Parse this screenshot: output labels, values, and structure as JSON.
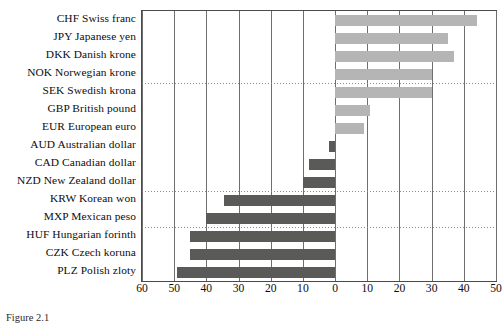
{
  "chart_data": {
    "type": "bar",
    "orientation": "horizontal",
    "title": "",
    "xlabel": "",
    "ylabel": "",
    "xlim": [
      -60,
      50
    ],
    "xticks": [
      -60,
      -50,
      -40,
      -30,
      -20,
      -10,
      0,
      10,
      20,
      30,
      40,
      50
    ],
    "xticklabels": [
      "60",
      "50",
      "40",
      "30",
      "20",
      "10",
      "0",
      "10",
      "20",
      "30",
      "40",
      "50"
    ],
    "grid": {
      "vertical": true,
      "horizontal_dotted": true
    },
    "legend": null,
    "colors": {
      "positive": "#b5b5b5",
      "negative": "#5a5a58",
      "axis": "#4a4a4a",
      "grid": "#6f6f6f"
    },
    "categories": [
      "CHF Swiss franc",
      "JPY Japanese yen",
      "DKK Danish krone",
      "NOK Norwegian krone",
      "SEK Swedish krona",
      "GBP British pound",
      "EUR European euro",
      "AUD Australian dollar",
      "CAD Canadian dollar",
      "NZD New Zealand dollar",
      "KRW Korean won",
      "MXP Mexican peso",
      "HUF Hungarian forinth",
      "CZK Czech koruna",
      "PLZ Polish zloty"
    ],
    "values": [
      44,
      35,
      37,
      30,
      30,
      11,
      9,
      -2,
      -8,
      -10,
      -34.5,
      -40,
      -45,
      -45,
      -49
    ]
  },
  "caption": {
    "text": "Figure 2.1"
  }
}
